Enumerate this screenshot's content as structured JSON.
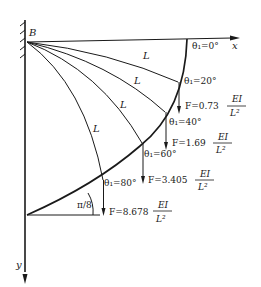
{
  "diagram": {
    "support_label": "B",
    "x_axis_label": "x",
    "y_axis_label": "y",
    "segment_label": "L",
    "end_angle_label": "π/8",
    "states": [
      {
        "angle_label": "θ₁=0°",
        "force_label": null
      },
      {
        "angle_label": "θ₁=20°",
        "force_label": "F=0.73",
        "force_unit_num": "EI",
        "force_unit_den": "L²"
      },
      {
        "angle_label": "θ₁=40°",
        "force_label": "F=1.69",
        "force_unit_num": "EI",
        "force_unit_den": "L²"
      },
      {
        "angle_label": "θ₁=60°",
        "force_label": "F=3.405",
        "force_unit_num": "EI",
        "force_unit_den": "L²"
      },
      {
        "angle_label": "θ₁=80°",
        "force_label": "F=8.678",
        "force_unit_num": "EI",
        "force_unit_den": "L²"
      }
    ],
    "colors": {
      "ink": "#1a1a1a",
      "background": "#ffffff"
    }
  }
}
